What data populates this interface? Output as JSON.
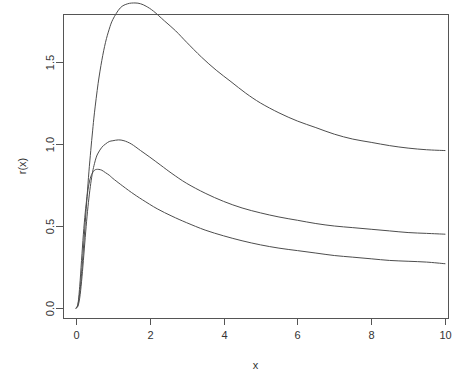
{
  "chart_data": {
    "type": "line",
    "title": "",
    "subtitle": "",
    "xlabel": "x",
    "ylabel": "r(x)",
    "xlim": [
      0,
      10
    ],
    "ylim": [
      0.0,
      1.88
    ],
    "xticks": [
      0,
      2,
      4,
      6,
      8,
      10
    ],
    "xtick_labels": [
      "0",
      "2",
      "4",
      "6",
      "8",
      "10"
    ],
    "yticks": [
      0.0,
      0.5,
      1.0,
      1.5
    ],
    "ytick_labels": [
      "0.0",
      "0.5",
      "1.0",
      "1.5"
    ],
    "grid": false,
    "legend": "none",
    "box": "full-rectangle",
    "line_color": "#4d4d4d",
    "line_width": 1,
    "axis_color": "#555555",
    "background": "#ffffff",
    "series": [
      {
        "name": "curve-upper",
        "peak_x": 1.75,
        "peak_y": 1.85,
        "end_y": 0.96,
        "x": [
          0.0,
          0.05,
          0.1,
          0.15,
          0.2,
          0.25,
          0.3,
          0.35,
          0.4,
          0.45,
          0.5,
          0.6,
          0.7,
          0.8,
          0.9,
          1.0,
          1.2,
          1.4,
          1.6,
          1.75,
          1.9,
          2.1,
          2.4,
          2.7,
          3.0,
          3.4,
          3.8,
          4.2,
          4.6,
          5.0,
          5.5,
          6.0,
          6.5,
          7.0,
          7.5,
          8.0,
          8.5,
          9.0,
          9.5,
          10.0
        ],
        "values": [
          0.0,
          0.02,
          0.09,
          0.21,
          0.36,
          0.52,
          0.68,
          0.83,
          0.96,
          1.08,
          1.19,
          1.37,
          1.51,
          1.62,
          1.7,
          1.76,
          1.83,
          1.855,
          1.86,
          1.855,
          1.84,
          1.81,
          1.75,
          1.69,
          1.62,
          1.53,
          1.45,
          1.38,
          1.31,
          1.25,
          1.19,
          1.14,
          1.1,
          1.06,
          1.03,
          1.01,
          0.99,
          0.975,
          0.965,
          0.96
        ]
      },
      {
        "name": "curve-middle",
        "peak_x": 1.15,
        "peak_y": 1.02,
        "end_y": 0.45,
        "x": [
          0.0,
          0.05,
          0.1,
          0.15,
          0.2,
          0.25,
          0.3,
          0.35,
          0.4,
          0.45,
          0.5,
          0.55,
          0.6,
          0.7,
          0.8,
          0.9,
          1.0,
          1.15,
          1.3,
          1.5,
          1.75,
          2.0,
          2.3,
          2.6,
          3.0,
          3.5,
          4.0,
          4.5,
          5.0,
          5.5,
          6.0,
          6.5,
          7.0,
          7.5,
          8.0,
          8.5,
          9.0,
          9.5,
          10.0
        ],
        "values": [
          0.0,
          0.01,
          0.06,
          0.16,
          0.29,
          0.43,
          0.56,
          0.67,
          0.76,
          0.83,
          0.88,
          0.92,
          0.945,
          0.98,
          1.0,
          1.015,
          1.02,
          1.025,
          1.02,
          1.0,
          0.96,
          0.92,
          0.87,
          0.82,
          0.76,
          0.7,
          0.65,
          0.61,
          0.58,
          0.555,
          0.535,
          0.515,
          0.5,
          0.49,
          0.48,
          0.47,
          0.46,
          0.455,
          0.45
        ]
      },
      {
        "name": "curve-lower",
        "peak_x": 0.62,
        "peak_y": 0.845,
        "end_y": 0.27,
        "x": [
          0.0,
          0.05,
          0.1,
          0.15,
          0.2,
          0.25,
          0.3,
          0.35,
          0.4,
          0.45,
          0.5,
          0.55,
          0.62,
          0.7,
          0.8,
          0.9,
          1.0,
          1.2,
          1.5,
          1.8,
          2.2,
          2.6,
          3.0,
          3.5,
          4.0,
          4.5,
          5.0,
          5.5,
          6.0,
          6.5,
          7.0,
          7.5,
          8.0,
          8.5,
          9.0,
          9.5,
          10.0
        ],
        "values": [
          0.0,
          0.02,
          0.13,
          0.29,
          0.45,
          0.58,
          0.68,
          0.755,
          0.8,
          0.825,
          0.84,
          0.845,
          0.845,
          0.84,
          0.825,
          0.81,
          0.79,
          0.755,
          0.705,
          0.66,
          0.605,
          0.56,
          0.52,
          0.475,
          0.44,
          0.41,
          0.385,
          0.365,
          0.35,
          0.335,
          0.32,
          0.31,
          0.3,
          0.29,
          0.285,
          0.28,
          0.27
        ]
      }
    ]
  },
  "geometry": {
    "plot_left": 63,
    "plot_right": 448,
    "plot_top": 14,
    "plot_bottom": 318,
    "x0_px": 76,
    "x_per_unit": 36.9,
    "y0_px": 308,
    "y_per_unit": 164
  }
}
